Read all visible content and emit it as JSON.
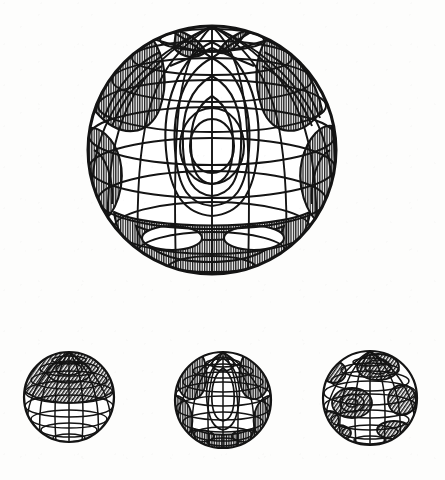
{
  "figure": {
    "title": "",
    "caption": "",
    "background_color": "#fdfdfc",
    "ink_color": "#141414",
    "hatch_color": "#1a1a1a",
    "fill_color": "#ffffff",
    "type": "technical-line-drawing"
  },
  "chart_data": {
    "type": "line",
    "title": "",
    "subtitle": "",
    "xlabel": "",
    "ylabel": "",
    "render_style": "wireframe-sphere-with-contours",
    "shading_style": "vertical-line-hatch",
    "projection": "orthographic",
    "panels": [
      {
        "id": "panel-main",
        "name": "large-sphere",
        "role": "primary",
        "center_x": 212,
        "center_y": 150,
        "radius": 124,
        "latitude_lines": 9,
        "longitude_lines": 12,
        "contour_levels": 7,
        "hatched_lobes": 6,
        "pole_visible": true,
        "pole_feature": "saddle-crossing",
        "description": "Large orthographic sphere with latitude-longitude graticule and nested closed contour curves; negative lobes filled with vertical hatching."
      },
      {
        "id": "panel-a",
        "name": "small-sphere-left",
        "role": "inset",
        "center_x": 69,
        "center_y": 397,
        "radius": 45,
        "latitude_lines": 9,
        "longitude_lines": 12,
        "contour_levels": 3,
        "hatched_lobes": 1,
        "pole_visible": true,
        "pole_feature": "polar-cap",
        "description": "Small sphere with a single hatched polar cap above the equator."
      },
      {
        "id": "panel-b",
        "name": "small-sphere-middle",
        "role": "inset",
        "center_x": 223,
        "center_y": 400,
        "radius": 48,
        "latitude_lines": 9,
        "longitude_lines": 12,
        "contour_levels": 5,
        "hatched_lobes": 5,
        "pole_visible": true,
        "pole_feature": "ring",
        "description": "Small sphere reproducing the main pattern at reduced scale with several hatched lobes."
      },
      {
        "id": "panel-c",
        "name": "small-sphere-right",
        "role": "inset",
        "center_x": 370,
        "center_y": 398,
        "radius": 47,
        "latitude_lines": 9,
        "longitude_lines": 12,
        "contour_levels": 4,
        "hatched_lobes": 7,
        "pole_visible": false,
        "pole_feature": "blob-cluster",
        "description": "Small sphere covered with scattered rounded hatched blobs of higher angular order."
      }
    ],
    "legend": [],
    "annotations": [],
    "grid": true
  }
}
